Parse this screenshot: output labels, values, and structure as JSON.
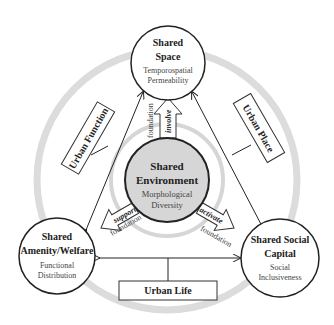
{
  "nodes": {
    "top": {
      "title1": "Shared",
      "title2": "Space",
      "sub1": "Temporospatial",
      "sub2": "Permeability"
    },
    "center": {
      "title1": "Shared",
      "title2": "Environment",
      "sub1": "Morphological",
      "sub2": "Diversity",
      "fill": "#d6d6d6"
    },
    "left": {
      "title1": "Shared",
      "title2": "Amenity/Welfare",
      "sub1": "Functional",
      "sub2": "Distribution"
    },
    "right": {
      "title1": "Shared Social",
      "title2": "Capital",
      "sub1": "Social",
      "sub2": "Inclusiveness"
    }
  },
  "labels": {
    "urban_function": "Urban Function",
    "urban_place": "Urban Place",
    "urban_life": "Urban Life"
  },
  "arrows": {
    "involve": "involve",
    "support": "support",
    "activate": "activate",
    "foundation": "foundation"
  },
  "colors": {
    "ring": "#d9d9d9",
    "line": "#222222"
  }
}
